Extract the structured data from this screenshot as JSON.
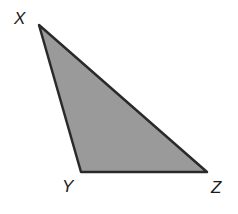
{
  "diagram": {
    "type": "triangle",
    "fill_color": "#9a9a9a",
    "stroke_color": "#2a2a2a",
    "vertices": [
      {
        "label": "X",
        "x": 39,
        "y": 25
      },
      {
        "label": "Y",
        "x": 81,
        "y": 172
      },
      {
        "label": "Z",
        "x": 207,
        "y": 172
      }
    ],
    "labels": {
      "x": "X",
      "y": "Y",
      "z": "Z"
    }
  }
}
